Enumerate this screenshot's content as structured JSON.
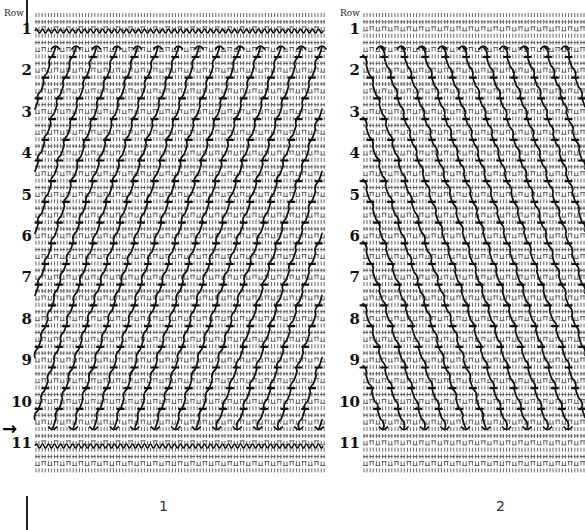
{
  "figure": {
    "type": "stitch-diagram",
    "panels": [
      {
        "id": "panel-1",
        "caption": "1",
        "row_header": "Row",
        "rows": [
          "1",
          "2",
          "3",
          "4",
          "5",
          "6",
          "7",
          "8",
          "9",
          "10",
          "11"
        ],
        "diagonal_direction": "up-right",
        "current_row_marker": "→"
      },
      {
        "id": "panel-2",
        "caption": "2",
        "row_header": "Row",
        "rows": [
          "1",
          "2",
          "3",
          "4",
          "5",
          "6",
          "7",
          "8",
          "9",
          "10",
          "11"
        ],
        "diagonal_direction": "down-right"
      }
    ],
    "colors": {
      "ink": "#111111",
      "grid": "#555555",
      "background": "#ffffff"
    }
  }
}
